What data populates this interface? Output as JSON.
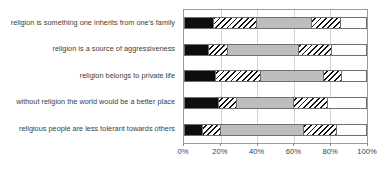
{
  "chart_data": {
    "type": "bar",
    "orientation": "horizontal",
    "stacked": true,
    "normalized": true,
    "title": "",
    "subtitle": "",
    "xlabel": "",
    "ylabel": "",
    "xlim": [
      0,
      100
    ],
    "grid": true,
    "legend": "none",
    "xticks": [
      0,
      20,
      40,
      60,
      80,
      100
    ],
    "xticklabels": [
      "0%",
      "20%",
      "40%",
      "60%",
      "80%",
      "100%"
    ],
    "categories": [
      "religion is something one inherits from one's family",
      "religion is a source of aggressiveness",
      "religion belongs to private life",
      "without religion the world would be a better place",
      "religious people are less tolerant towards others"
    ],
    "series": [
      {
        "name": "segment-1",
        "fill": "black",
        "color": "#0d0d0d",
        "values": [
          16,
          13,
          17,
          19,
          10
        ]
      },
      {
        "name": "segment-2",
        "fill": "hatch",
        "color": "#111111",
        "values": [
          24,
          11,
          25,
          10,
          10
        ]
      },
      {
        "name": "segment-3",
        "fill": "gray",
        "color": "#bdbdbd",
        "values": [
          30,
          39,
          35,
          31,
          46
        ]
      },
      {
        "name": "segment-4",
        "fill": "hatch",
        "color": "#111111",
        "values": [
          16,
          18,
          10,
          19,
          18
        ]
      },
      {
        "name": "segment-5",
        "fill": "white",
        "color": "#ffffff",
        "values": [
          14,
          19,
          13,
          21,
          16
        ]
      }
    ],
    "cumulative": [
      [
        16,
        40,
        70,
        86,
        100
      ],
      [
        13,
        24,
        63,
        81,
        100
      ],
      [
        17,
        42,
        77,
        87,
        100
      ],
      [
        19,
        29,
        60,
        79,
        100
      ],
      [
        10,
        20,
        66,
        84,
        100
      ]
    ]
  },
  "colors": {
    "axis": "#9a9a9a",
    "grid": "#d2d2d2",
    "text": "#3c3c3c",
    "bar_border": "#6e6e6e",
    "black_fill": "#0d0d0d",
    "gray_fill": "#bdbdbd",
    "white_fill": "#ffffff"
  }
}
